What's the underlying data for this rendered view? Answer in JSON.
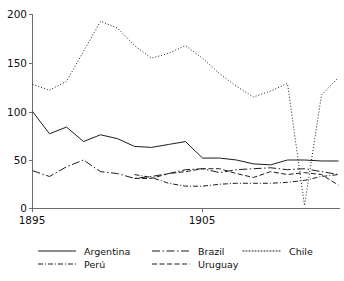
{
  "chart_data": {
    "type": "line",
    "title": "",
    "xlabel": "",
    "ylabel": "",
    "xlim": [
      1895,
      1913
    ],
    "ylim": [
      0,
      200
    ],
    "grid": false,
    "legend_position": "bottom",
    "x_tick_labels": [
      "1895",
      "1905"
    ],
    "x_tick_values": [
      1895,
      1905
    ],
    "y_tick_labels": [
      "0",
      "50",
      "100",
      "150",
      "200"
    ],
    "y_tick_values": [
      0,
      50,
      100,
      150,
      200
    ],
    "x": [
      1895,
      1896,
      1897,
      1898,
      1899,
      1900,
      1901,
      1902,
      1903,
      1904,
      1905,
      1906,
      1907,
      1908,
      1909,
      1910,
      1911,
      1912,
      1913
    ],
    "series": [
      {
        "name": "Argentina",
        "style": "solid",
        "x": [
          1895,
          1896,
          1897,
          1898,
          1899,
          1900,
          1901,
          1902,
          1903,
          1904,
          1905,
          1906,
          1907,
          1908,
          1909,
          1910,
          1911,
          1912,
          1913
        ],
        "values": [
          100,
          77,
          84,
          69,
          76,
          72,
          64,
          63,
          66,
          69,
          52,
          52,
          50,
          46,
          45,
          50,
          50,
          49,
          49
        ]
      },
      {
        "name": "Brazil",
        "style": "long-dash-dot",
        "x": [
          1895,
          1896,
          1897,
          1898,
          1899,
          1900,
          1901,
          1902,
          1903,
          1904,
          1905,
          1906,
          1907,
          1908,
          1909,
          1910,
          1911,
          1912,
          1913
        ],
        "values": [
          39,
          33,
          43,
          50,
          38,
          36,
          31,
          33,
          36,
          40,
          41,
          37,
          40,
          41,
          42,
          40,
          41,
          38,
          35
        ]
      },
      {
        "name": "Chile",
        "style": "dotted",
        "x": [
          1895,
          1896,
          1897,
          1898,
          1899,
          1900,
          1901,
          1902,
          1903,
          1904,
          1905,
          1906,
          1907,
          1908,
          1909,
          1910,
          1911,
          1912,
          1913
        ],
        "values": [
          128,
          122,
          131,
          162,
          193,
          186,
          168,
          155,
          160,
          168,
          155,
          139,
          126,
          115,
          121,
          129,
          3,
          117,
          135
        ]
      },
      {
        "name": "Perú",
        "style": "dash-dot",
        "x": [
          1901,
          1902,
          1903,
          1904,
          1905,
          1906,
          1907,
          1908,
          1909,
          1910,
          1911,
          1912,
          1913
        ],
        "values": [
          35,
          32,
          26,
          23,
          23,
          25,
          26,
          26,
          26,
          27,
          29,
          33,
          35
        ]
      },
      {
        "name": "Uruguay",
        "style": "dashed",
        "x": [
          1901,
          1902,
          1903,
          1904,
          1905,
          1906,
          1907,
          1908,
          1909,
          1910,
          1911,
          1912,
          1913
        ],
        "values": [
          31,
          31,
          36,
          38,
          41,
          41,
          36,
          32,
          38,
          35,
          37,
          35,
          24
        ]
      }
    ],
    "legend_entries": [
      {
        "label": "Argentina",
        "style": "solid"
      },
      {
        "label": "Brazil",
        "style": "long-dash-dot"
      },
      {
        "label": "Chile",
        "style": "dotted"
      },
      {
        "label": "Perú",
        "style": "dash-dot"
      },
      {
        "label": "Uruguay",
        "style": "dashed"
      }
    ]
  },
  "axis": {
    "y_labels": [
      "200",
      "150",
      "100",
      "50",
      "0"
    ],
    "x_labels": [
      "1895",
      "1905"
    ]
  },
  "colors": {
    "ink": "#1d1d1d",
    "axis": "#6b6b6b",
    "background": "#ffffff"
  }
}
